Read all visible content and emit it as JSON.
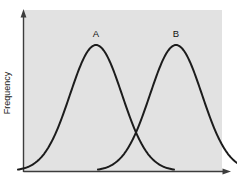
{
  "figure": {
    "width": 237,
    "height": 186,
    "background": "#ffffff",
    "plot_background": "#e2e2e2",
    "axis_color": "#3c3c3c",
    "curve_color": "#1c1c1c"
  },
  "axes": {
    "ylabel": "Frequency",
    "xlabel": "",
    "y_axis_arrow": true,
    "x_axis_arrow": true,
    "ticks": []
  },
  "labels": {
    "curve_a": "A",
    "curve_b": "B"
  },
  "chart_data": {
    "type": "line",
    "title": "",
    "xlabel": "",
    "ylabel": "Frequency",
    "grid": false,
    "legend": "none",
    "annotations": [
      {
        "text": "A",
        "x": 96,
        "y": 34
      },
      {
        "text": "B",
        "x": 176,
        "y": 34
      }
    ],
    "xlim": [
      0,
      237
    ],
    "ylim": [
      0,
      1
    ],
    "series": [
      {
        "name": "A",
        "type": "normal-distribution",
        "mean": 96,
        "std": 26,
        "peak_x": 96,
        "peak_y": 1.0,
        "values": [
          0.0,
          0.001,
          0.002,
          0.005,
          0.011,
          0.022,
          0.041,
          0.071,
          0.115,
          0.175,
          0.251,
          0.341,
          0.441,
          0.544,
          0.644,
          0.734,
          0.809,
          0.887,
          0.941,
          0.977,
          0.997,
          1.0,
          0.988,
          0.962,
          0.922,
          0.869,
          0.806,
          0.734,
          0.656,
          0.576,
          0.495,
          0.417,
          0.343,
          0.276,
          0.216,
          0.165,
          0.122,
          0.088,
          0.061,
          0.041,
          0.027,
          0.017,
          0.01,
          0.006,
          0.003,
          0.002,
          0.001,
          0.0
        ]
      },
      {
        "name": "B",
        "type": "normal-distribution",
        "mean": 176,
        "std": 26,
        "peak_x": 176,
        "peak_y": 1.0,
        "values": [
          0.0,
          0.001,
          0.002,
          0.005,
          0.011,
          0.022,
          0.041,
          0.071,
          0.115,
          0.175,
          0.251,
          0.341,
          0.441,
          0.544,
          0.644,
          0.734,
          0.809,
          0.887,
          0.941,
          0.977,
          0.997,
          1.0,
          0.988,
          0.962,
          0.922,
          0.869,
          0.806,
          0.734,
          0.656,
          0.576,
          0.495,
          0.417,
          0.343,
          0.276,
          0.216,
          0.165,
          0.122,
          0.088,
          0.061,
          0.041,
          0.027,
          0.017,
          0.01,
          0.006,
          0.003,
          0.002,
          0.001,
          0.0
        ]
      }
    ],
    "intersection": {
      "x": 136,
      "y": 0.03
    }
  }
}
